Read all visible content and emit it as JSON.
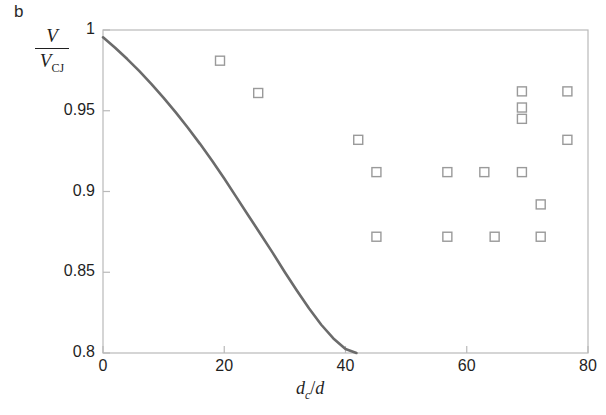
{
  "figure": {
    "panel_label": "b"
  },
  "chart_data": {
    "type": "scatter",
    "title": "",
    "subtitle": "",
    "xlabel": "d_c /d",
    "xlabel_parts": {
      "base": "d",
      "sub": "c",
      "slash": "/",
      "denom": "d"
    },
    "ylabel": "V / V_CJ",
    "ylabel_parts": {
      "numerator": "V",
      "denominator": "V",
      "denominator_sub": "CJ"
    },
    "xlim": [
      0,
      80
    ],
    "ylim": [
      0.8,
      1.0
    ],
    "xticks": [
      0,
      20,
      40,
      60,
      80
    ],
    "xtick_labels": [
      "0",
      "20",
      "40",
      "60",
      "80"
    ],
    "yticks": [
      0.8,
      0.85,
      0.9,
      0.95,
      1.0
    ],
    "ytick_labels": [
      "0.8",
      "0.85",
      "0.9",
      "0.95",
      "1"
    ],
    "grid": false,
    "legend": null,
    "series": [
      {
        "name": "measured data",
        "type": "scatter",
        "marker": "open-square",
        "marker_color": "#9a9a9a",
        "points": [
          {
            "x": 19.3,
            "y": 0.981
          },
          {
            "x": 25.6,
            "y": 0.961
          },
          {
            "x": 42.1,
            "y": 0.932
          },
          {
            "x": 45.1,
            "y": 0.912
          },
          {
            "x": 45.1,
            "y": 0.872
          },
          {
            "x": 56.8,
            "y": 0.912
          },
          {
            "x": 56.8,
            "y": 0.872
          },
          {
            "x": 62.9,
            "y": 0.912
          },
          {
            "x": 64.6,
            "y": 0.872
          },
          {
            "x": 69.1,
            "y": 0.962
          },
          {
            "x": 69.1,
            "y": 0.952
          },
          {
            "x": 69.1,
            "y": 0.945
          },
          {
            "x": 69.1,
            "y": 0.912
          },
          {
            "x": 72.2,
            "y": 0.892
          },
          {
            "x": 72.2,
            "y": 0.872
          },
          {
            "x": 76.6,
            "y": 0.962
          },
          {
            "x": 76.6,
            "y": 0.932
          }
        ]
      },
      {
        "name": "theoretical curve",
        "type": "line",
        "line_color": "#6b6b6b",
        "points": [
          {
            "x": 0.0,
            "y": 0.9955
          },
          {
            "x": 2.0,
            "y": 0.989
          },
          {
            "x": 4.0,
            "y": 0.982
          },
          {
            "x": 6.0,
            "y": 0.9745
          },
          {
            "x": 8.0,
            "y": 0.9665
          },
          {
            "x": 10.0,
            "y": 0.958
          },
          {
            "x": 12.0,
            "y": 0.949
          },
          {
            "x": 14.0,
            "y": 0.9395
          },
          {
            "x": 16.0,
            "y": 0.9295
          },
          {
            "x": 18.0,
            "y": 0.919
          },
          {
            "x": 20.0,
            "y": 0.908
          },
          {
            "x": 22.0,
            "y": 0.8965
          },
          {
            "x": 24.0,
            "y": 0.885
          },
          {
            "x": 26.0,
            "y": 0.8735
          },
          {
            "x": 28.0,
            "y": 0.862
          },
          {
            "x": 30.0,
            "y": 0.85
          },
          {
            "x": 32.0,
            "y": 0.8385
          },
          {
            "x": 34.0,
            "y": 0.8275
          },
          {
            "x": 36.0,
            "y": 0.8175
          },
          {
            "x": 38.0,
            "y": 0.809
          },
          {
            "x": 40.0,
            "y": 0.8025
          },
          {
            "x": 41.8,
            "y": 0.8
          }
        ]
      }
    ],
    "axis_frame": {
      "color": "#b9b9b9",
      "sides": [
        "left",
        "right",
        "top",
        "bottom"
      ]
    }
  }
}
